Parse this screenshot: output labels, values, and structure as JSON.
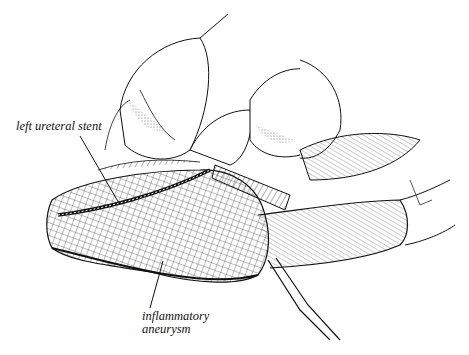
{
  "figure": {
    "type": "surgical line illustration",
    "labels": [
      {
        "id": "stent",
        "text": "left ureteral stent",
        "line2": ""
      },
      {
        "id": "aneurysm",
        "text": "inflammatory",
        "line2": "aneurysm"
      }
    ]
  },
  "colors": {
    "ink": "#111111",
    "background": "#ffffff",
    "shade": "#555555"
  }
}
